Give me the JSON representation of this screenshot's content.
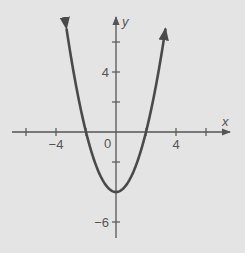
{
  "chart_data": {
    "type": "line",
    "title": "",
    "function": "y = x^2 - 4",
    "xlabel": "x",
    "ylabel": "y",
    "xlim": [
      -7,
      7.6
    ],
    "ylim": [
      -7,
      7.6
    ],
    "grid": false,
    "x_ticks": [
      -6,
      -4,
      -2,
      2,
      4,
      6
    ],
    "y_ticks": [
      -6,
      -2,
      2,
      4,
      6
    ],
    "x_tick_labels": [
      {
        "value": -4,
        "label": "−4"
      },
      {
        "value": 4,
        "label": "4"
      }
    ],
    "y_tick_labels": [
      {
        "value": 4,
        "label": "4"
      },
      {
        "value": -6,
        "label": "−6"
      }
    ],
    "origin_label": "0",
    "vertex": [
      0,
      -4
    ],
    "x_intercepts": [
      -2,
      2
    ],
    "series": [
      {
        "name": "parabola",
        "x": [
          -3.3,
          -3,
          -2,
          -1,
          0,
          1,
          2,
          3,
          3.3
        ],
        "y": [
          6.89,
          5,
          0,
          -3,
          -4,
          -3,
          0,
          5,
          6.89
        ]
      }
    ],
    "colors": {
      "background": "#e4e4e4",
      "curve": "#4a4a4a",
      "axis": "#555555"
    }
  }
}
